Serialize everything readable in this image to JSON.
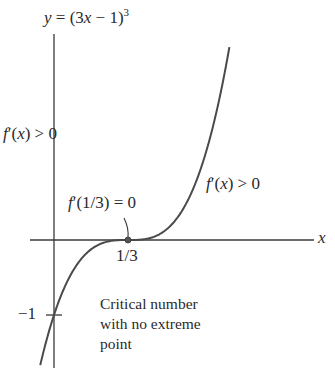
{
  "title": {
    "lhs": "y",
    "eq": " = (3",
    "var": "x",
    "rest": " − 1)",
    "exp": "3"
  },
  "axes": {
    "x_label": "x",
    "y_tick_label": "−1",
    "x_tick_label": "1/3"
  },
  "annotations": {
    "left": {
      "f": "f",
      "prime": "′(",
      "x": "x",
      "close": ") > 0"
    },
    "right": {
      "f": "f",
      "prime": "′(",
      "x": "x",
      "close": ") > 0"
    },
    "critical": {
      "f": "f",
      "text": "′(1/3) = 0"
    },
    "note_lines": [
      "Critical number",
      "with no extreme",
      "point"
    ]
  },
  "colors": {
    "axis": "#3a3a3a",
    "curve": "#4a4a4a",
    "point": "#555555",
    "text": "#2a2a2a"
  },
  "chart_data": {
    "type": "line",
    "xlabel": "x",
    "ylabel": "y",
    "function": "(3x-1)^3",
    "x": [
      -0.06,
      0.0,
      0.1,
      0.2,
      0.3,
      0.3333,
      0.4,
      0.5,
      0.6,
      0.7,
      0.79
    ],
    "y": [
      -1.66,
      -1.0,
      -0.343,
      -0.064,
      -0.001,
      0.0,
      0.008,
      0.125,
      0.512,
      1.331,
      2.53
    ],
    "ticks": {
      "x": [
        "1/3"
      ],
      "y": [
        "−1"
      ]
    },
    "points": [
      {
        "x": 0.3333,
        "y": 0,
        "label": "f′(1/3) = 0"
      }
    ],
    "annotations": [
      "f′(x) > 0",
      "f′(x) > 0",
      "f′(1/3) = 0",
      "Critical number with no extreme point"
    ],
    "grid": false
  }
}
